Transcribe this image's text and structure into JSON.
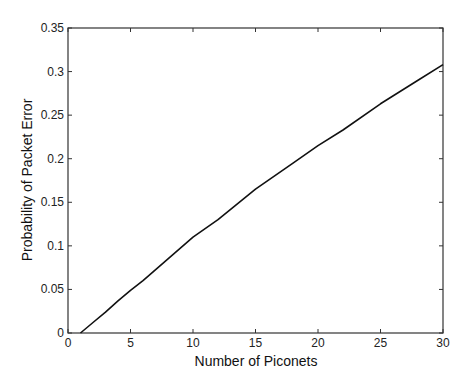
{
  "chart_data": {
    "type": "line",
    "title": "",
    "xlabel": "Number of Piconets",
    "ylabel": "Probability of Packet Error",
    "xlim": [
      0,
      30
    ],
    "ylim": [
      0,
      0.35
    ],
    "xticks": [
      0,
      5,
      10,
      15,
      20,
      25,
      30
    ],
    "yticks": [
      0,
      0.05,
      0.1,
      0.15,
      0.2,
      0.25,
      0.3,
      0.35
    ],
    "xtick_labels": [
      "0",
      "5",
      "10",
      "15",
      "20",
      "25",
      "30"
    ],
    "ytick_labels": [
      "0",
      "0.05",
      "0.1",
      "0.15",
      "0.2",
      "0.25",
      "0.3",
      "0.35"
    ],
    "grid": false,
    "legend": null,
    "series": [
      {
        "name": "Packet error probability",
        "x": [
          1,
          2,
          3,
          4,
          5,
          6,
          8,
          10,
          12,
          15,
          18,
          20,
          22,
          25,
          28,
          30
        ],
        "y": [
          0,
          0.012,
          0.024,
          0.037,
          0.049,
          0.06,
          0.085,
          0.11,
          0.13,
          0.165,
          0.195,
          0.215,
          0.233,
          0.263,
          0.29,
          0.308
        ]
      }
    ],
    "colors": {
      "line": "#111111",
      "axis": "#333333"
    }
  }
}
